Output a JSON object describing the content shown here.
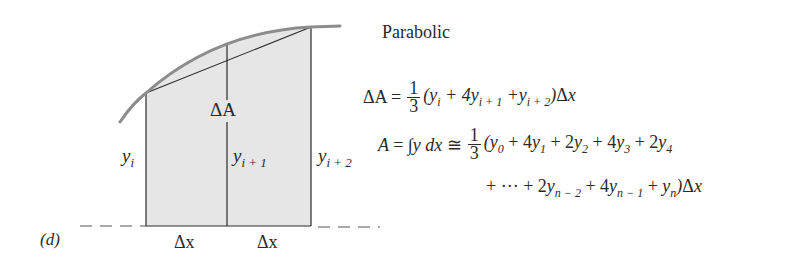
{
  "figure": {
    "panel_label": "(d)",
    "title": "Parabolic",
    "diagram": {
      "region_label": "ΔA",
      "ordinates": [
        "y_i",
        "y_{i+1}",
        "y_{i+2}"
      ],
      "ordinate_base": [
        "y",
        "y",
        "y"
      ],
      "ordinate_subs": [
        "i",
        "i + 1",
        "i + 2"
      ],
      "interval_labels": [
        "Δx",
        "Δx"
      ],
      "colors": {
        "fill": "#e6e6e6",
        "curve": "#8c8c8c",
        "lines": "#2a2a2a"
      }
    },
    "equations": {
      "strip": {
        "lhs": "ΔA =",
        "frac_num": "1",
        "frac_den": "3",
        "rhs": "(y_i + 4y_{i+1} + y_{i+2})Δx",
        "text": "ΔA = (1/3)(y_i + 4y_{i+1} + y_{i+2})Δx"
      },
      "total": {
        "lhs": "A = ∫y dx ≅",
        "frac_num": "1",
        "frac_den": "3",
        "rhs_line1": "(y_0 + 4y_1 + 2y_2 + 4y_3 + 2y_4",
        "rhs_line2": "+ ··· + 2y_{n−2} + 4y_{n−1} + y_n)Δx",
        "text": "A = ∫y dx ≅ (1/3)(y_0 + 4y_1 + 2y_2 + 4y_3 + 2y_4 + ··· + 2y_{n−2} + 4y_{n−1} + y_n)Δx"
      }
    }
  }
}
